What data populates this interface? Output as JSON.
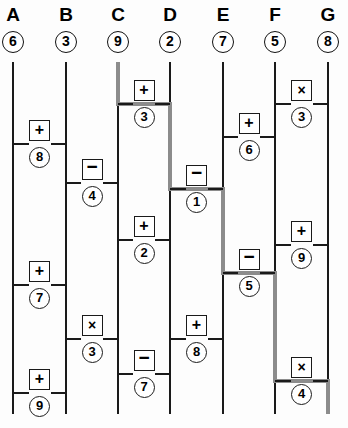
{
  "diagram": {
    "type": "ladder-flow",
    "geometry": {
      "width": 348,
      "height": 428,
      "rail_top": 62,
      "rail_bottom": 414,
      "column_x": [
        13,
        66,
        118,
        170,
        223,
        275,
        328
      ]
    },
    "colors": {
      "line": "#1a1a1a",
      "path_highlight": "#8c8c8c",
      "background": "#fdfdfd",
      "text": "#000000"
    }
  },
  "columns": [
    {
      "letter": "A",
      "start_value": "6",
      "x": 13
    },
    {
      "letter": "B",
      "start_value": "3",
      "x": 66
    },
    {
      "letter": "C",
      "start_value": "9",
      "x": 118
    },
    {
      "letter": "D",
      "start_value": "2",
      "x": 170
    },
    {
      "letter": "E",
      "start_value": "7",
      "x": 223
    },
    {
      "letter": "F",
      "start_value": "5",
      "x": 275
    },
    {
      "letter": "G",
      "start_value": "8",
      "x": 328
    }
  ],
  "rungs": [
    {
      "id": "fg-x3",
      "from": "F",
      "to": "G",
      "operator": "×",
      "operator_name": "times",
      "operand": "3",
      "y": 104,
      "on_path": false
    },
    {
      "id": "cd-p3",
      "from": "C",
      "to": "D",
      "operator": "+",
      "operator_name": "plus",
      "operand": "3",
      "y": 104,
      "on_path": true
    },
    {
      "id": "ef-p6",
      "from": "E",
      "to": "F",
      "operator": "+",
      "operator_name": "plus",
      "operand": "6",
      "y": 137,
      "on_path": false
    },
    {
      "id": "ab-p8",
      "from": "A",
      "to": "B",
      "operator": "+",
      "operator_name": "plus",
      "operand": "8",
      "y": 144,
      "on_path": false
    },
    {
      "id": "bc-m4",
      "from": "B",
      "to": "C",
      "operator": "−",
      "operator_name": "minus",
      "operand": "4",
      "y": 183,
      "on_path": false
    },
    {
      "id": "de-m1",
      "from": "D",
      "to": "E",
      "operator": "−",
      "operator_name": "minus",
      "operand": "1",
      "y": 189,
      "on_path": true
    },
    {
      "id": "cd-p2",
      "from": "C",
      "to": "D",
      "operator": "+",
      "operator_name": "plus",
      "operand": "2",
      "y": 240,
      "on_path": false
    },
    {
      "id": "fg-p9",
      "from": "F",
      "to": "G",
      "operator": "+",
      "operator_name": "plus",
      "operand": "9",
      "y": 245,
      "on_path": false
    },
    {
      "id": "ef-m5",
      "from": "E",
      "to": "F",
      "operator": "−",
      "operator_name": "minus",
      "operand": "5",
      "y": 273,
      "on_path": true
    },
    {
      "id": "ab-p7",
      "from": "A",
      "to": "B",
      "operator": "+",
      "operator_name": "plus",
      "operand": "7",
      "y": 285,
      "on_path": false
    },
    {
      "id": "bc-x3",
      "from": "B",
      "to": "C",
      "operator": "×",
      "operator_name": "times",
      "operand": "3",
      "y": 339,
      "on_path": false
    },
    {
      "id": "de-p8",
      "from": "D",
      "to": "E",
      "operator": "+",
      "operator_name": "plus",
      "operand": "8",
      "y": 339,
      "on_path": false
    },
    {
      "id": "cd-m7",
      "from": "C",
      "to": "D",
      "operator": "−",
      "operator_name": "minus",
      "operand": "7",
      "y": 374,
      "on_path": false
    },
    {
      "id": "fg-x4",
      "from": "F",
      "to": "G",
      "operator": "×",
      "operator_name": "times",
      "operand": "4",
      "y": 381,
      "on_path": true
    },
    {
      "id": "ab-p9",
      "from": "A",
      "to": "B",
      "operator": "+",
      "operator_name": "plus",
      "operand": "9",
      "y": 393,
      "on_path": false
    }
  ],
  "highlighted_path": {
    "start_column": "C",
    "end_column": "G",
    "steps": [
      {
        "column": "C",
        "from_y": 62,
        "to_y": 104
      },
      {
        "rung": "cd-p3",
        "y": 104,
        "from_x": 118,
        "to_x": 170
      },
      {
        "column": "D",
        "from_y": 104,
        "to_y": 189
      },
      {
        "rung": "de-m1",
        "y": 189,
        "from_x": 170,
        "to_x": 223
      },
      {
        "column": "E",
        "from_y": 189,
        "to_y": 273
      },
      {
        "rung": "ef-m5",
        "y": 273,
        "from_x": 223,
        "to_x": 275
      },
      {
        "column": "F",
        "from_y": 273,
        "to_y": 381
      },
      {
        "rung": "fg-x4",
        "y": 381,
        "from_x": 275,
        "to_x": 328
      },
      {
        "column": "G",
        "from_y": 381,
        "to_y": 414
      }
    ]
  }
}
